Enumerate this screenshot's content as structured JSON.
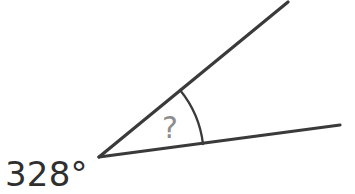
{
  "figure": {
    "type": "angle-diagram",
    "background_color": "#ffffff",
    "stroke_color": "#3a3a3a",
    "canvas": {
      "width": 355,
      "height": 194
    },
    "vertex": {
      "x": 99,
      "y": 157
    },
    "rays": [
      {
        "name": "upper-ray",
        "from": {
          "x": 99,
          "y": 157
        },
        "to": {
          "x": 288,
          "y": 2
        },
        "angle_degrees": 39.3
      },
      {
        "name": "lower-ray",
        "from": {
          "x": 99,
          "y": 157
        },
        "to": {
          "x": 340,
          "y": 125
        },
        "angle_degrees": 7.6
      }
    ],
    "arc": {
      "name": "interior-angle-arc",
      "radius": 105,
      "start": {
        "x": 180,
        "y": 90
      },
      "end": {
        "x": 203,
        "y": 144
      },
      "sweep_degrees": 31.7,
      "stroke_color": "#3a3a3a"
    }
  },
  "labels": {
    "unknown_angle": {
      "text": "?",
      "color": "#8d8d8d",
      "x": 170,
      "y": 138,
      "font_size": 30
    },
    "exterior_angle": {
      "text": "328°",
      "color": "#2f2f2f",
      "x": 5,
      "y": 186,
      "font_size": 34
    }
  }
}
